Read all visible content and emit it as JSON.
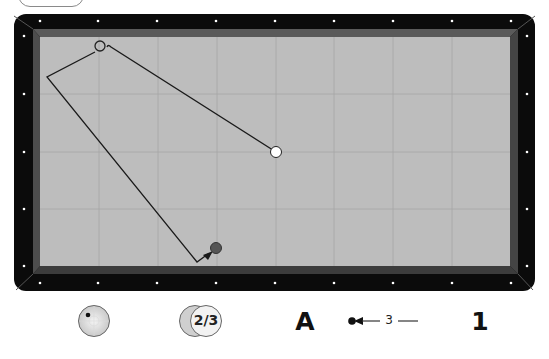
{
  "header": {
    "menu_button_label": ""
  },
  "table": {
    "rail_color": "#0b0b0b",
    "cushion_color": "#4a4a4a",
    "felt_color": "#bdbdbd",
    "grid_color": "#a8a8a8",
    "diamond_color": "#ffffff",
    "grid_columns": 8,
    "grid_rows": 4
  },
  "balls": {
    "cue_ball": {
      "color": "#ffffff",
      "label": "white cue ball"
    },
    "object_ball_red": {
      "color": "#5a5a5a",
      "label": "red object ball"
    },
    "ghost_ball": {
      "color": "none",
      "label": "second cue ball position"
    }
  },
  "shot_path": {
    "line_color": "#1a1a1a",
    "arrow": true
  },
  "controls": {
    "spin_icon": "cue-ball-spin-icon",
    "thickness_label": "2/3",
    "thickness_icon": "ball-overlap-icon",
    "shot_letter": "A",
    "stroke_icon": "cue-stroke-icon",
    "stroke_value": "3",
    "shot_number": "1"
  }
}
